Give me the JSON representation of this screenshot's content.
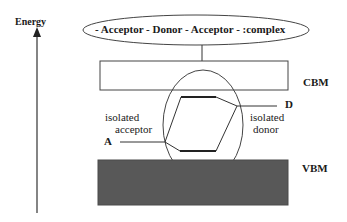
{
  "axis": {
    "label": "Energy"
  },
  "complex": {
    "label": "- Acceptor - Donor - Acceptor - :complex"
  },
  "bands": {
    "cbm": {
      "label": "CBM"
    },
    "vbm": {
      "label": "VBM",
      "fill": "#585858"
    }
  },
  "levels": {
    "acceptor": {
      "desc_line1": "isolated",
      "desc_line2": "acceptor",
      "marker": "A"
    },
    "donor": {
      "desc_line1": "isolated",
      "desc_line2": "donor",
      "marker": "D"
    }
  },
  "colors": {
    "line": "#333333",
    "band_fill": "#585858"
  }
}
